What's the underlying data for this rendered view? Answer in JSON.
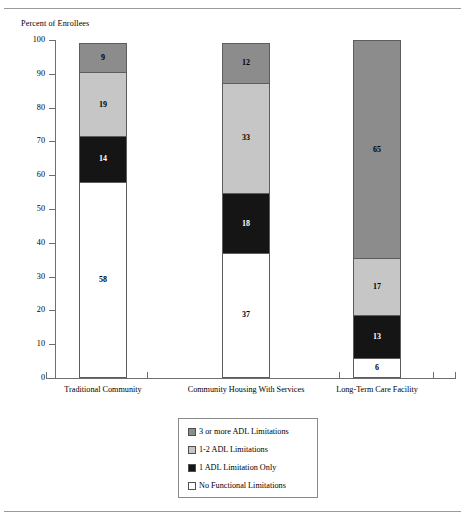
{
  "chart_data": {
    "type": "bar",
    "subtype": "stacked-bar-100",
    "title": "",
    "ylabel": "Percent of Enrollees",
    "xlabel": "",
    "ylim": [
      0,
      100
    ],
    "yticks": [
      0,
      10,
      20,
      30,
      40,
      50,
      60,
      70,
      80,
      90,
      100
    ],
    "grid": false,
    "legend_position": "bottom-center",
    "categories": [
      "Traditional Community",
      "Community Housing With Services",
      "Long-Term Care Facility"
    ],
    "series": [
      {
        "name": "No Functional Limitations",
        "color": "#ffffff",
        "values": [
          58,
          37,
          6
        ]
      },
      {
        "name": "1 ADL Limitation Only",
        "color": "#151515",
        "values": [
          14,
          18,
          13
        ]
      },
      {
        "name": "1-2 ADL Limitations",
        "color": "#c6c6c6",
        "values": [
          19,
          33,
          17
        ]
      },
      {
        "name": "3 or more ADL Limitations",
        "color": "#8c8c8c",
        "values": [
          9,
          12,
          65
        ]
      }
    ]
  },
  "axis": {
    "y_title": "Percent of Enrollees",
    "y_labels": [
      "100",
      "90",
      "80",
      "70",
      "60",
      "50",
      "40",
      "30",
      "20",
      "10",
      "0"
    ],
    "x_labels": [
      "Traditional Community",
      "Community Housing  With Services",
      "Long-Term Care Facility"
    ]
  },
  "bars": [
    {
      "category": "Traditional Community",
      "segments": [
        {
          "label": "3 or more ADL Limitations",
          "value": "9",
          "pct": 9
        },
        {
          "label": "1-2 ADL Limitations",
          "value": "19",
          "pct": 19
        },
        {
          "label": "1 ADL Limitation Only",
          "value": "14",
          "pct": 14
        },
        {
          "label": "No Functional Limitations",
          "value": "58",
          "pct": 58
        }
      ]
    },
    {
      "category": "Community Housing With Services",
      "segments": [
        {
          "label": "3 or more ADL Limitations",
          "value": "12",
          "pct": 12
        },
        {
          "label": "1-2 ADL Limitations",
          "value": "33",
          "pct": 33
        },
        {
          "label": "1 ADL Limitation Only",
          "value": "18",
          "pct": 18
        },
        {
          "label": "No Functional Limitations",
          "value": "37",
          "pct": 37
        }
      ]
    },
    {
      "category": "Long-Term Care Facility",
      "segments": [
        {
          "label": "3 or more ADL Limitations",
          "value": "65",
          "pct": 65
        },
        {
          "label": "1-2 ADL Limitations",
          "value": "17",
          "pct": 17
        },
        {
          "label": "1 ADL Limitation Only",
          "value": "13",
          "pct": 13
        },
        {
          "label": "No Functional Limitations",
          "value": "6",
          "pct": 6
        }
      ]
    }
  ],
  "legend": {
    "items": [
      {
        "label": "3 or more ADL Limitations",
        "color": "#8c8c8c"
      },
      {
        "label": "1-2 ADL Limitations",
        "color": "#c6c6c6"
      },
      {
        "label": "1 ADL Limitation Only",
        "color": "#151515"
      },
      {
        "label": "No Functional Limitations",
        "color": "#ffffff"
      }
    ]
  },
  "colors": {
    "three_plus_adl": "#8c8c8c",
    "one_two_adl": "#c6c6c6",
    "one_adl": "#151515",
    "none": "#ffffff",
    "outline": "#5d5d5d",
    "axis": "#6f6f6f",
    "rule": "#9a9a9a"
  }
}
